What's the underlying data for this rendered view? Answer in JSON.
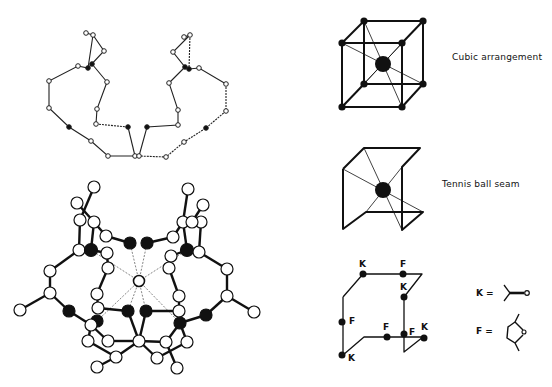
{
  "figure": {
    "panels": [
      {
        "id": "skeletal-chain",
        "description": "Skeletal line model of macrocyclic ligand"
      },
      {
        "id": "ball-and-stick",
        "description": "Ball-and-stick model with central metal coordinated by 8 oxygen atoms"
      },
      {
        "id": "cubic",
        "label": "Cubic arrangement"
      },
      {
        "id": "tennis",
        "label": "Tennis ball seam"
      },
      {
        "id": "kf-seam",
        "label": "K/F seam"
      }
    ],
    "kf_labels": [
      "K",
      "F",
      "K",
      "F",
      "F",
      "F",
      "K",
      "K"
    ],
    "legend": {
      "k_label": "K =",
      "f_label": "F ="
    }
  },
  "colors": {
    "ink": "#111111",
    "background": "#ffffff"
  }
}
